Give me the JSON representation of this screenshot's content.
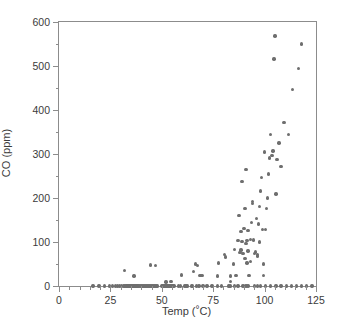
{
  "figure": {
    "caption": ""
  },
  "axes": {
    "x": {
      "title": "Temp (°C)",
      "ticks": [
        "0",
        "25",
        "50",
        "75",
        "100",
        "125"
      ]
    },
    "y": {
      "title": "CO (ppm)",
      "ticks": [
        "0",
        "100",
        "200",
        "300",
        "400",
        "500",
        "600"
      ]
    }
  },
  "chart_data": {
    "type": "scatter",
    "title": "",
    "xlabel": "Temp (°C)",
    "ylabel": "CO (ppm)",
    "xlim": [
      0,
      125
    ],
    "ylim": [
      0,
      600
    ],
    "xticks": [
      0,
      25,
      50,
      75,
      100,
      125
    ],
    "yticks": [
      0,
      100,
      200,
      300,
      400,
      500,
      600
    ],
    "x_minor_ticks_per_interval": 4,
    "y_minor_ticks_per_interval": 1,
    "grid": false,
    "legend": null,
    "marker": {
      "shape": "circle",
      "color": "#6e6e6e",
      "size_px": 3.4
    },
    "frame_color": "#8c8c8c",
    "background": "#ffffff",
    "n_points": 163,
    "series": [
      {
        "name": "CO vs Temp",
        "points": [
          [
            16.5,
            0
          ],
          [
            19.5,
            0
          ],
          [
            22.0,
            0
          ],
          [
            24.5,
            0
          ],
          [
            26.0,
            0
          ],
          [
            27.5,
            0
          ],
          [
            28.5,
            0
          ],
          [
            29.5,
            0
          ],
          [
            30.5,
            0
          ],
          [
            31.5,
            0
          ],
          [
            32.0,
            0
          ],
          [
            32.5,
            0
          ],
          [
            33.0,
            0
          ],
          [
            33.5,
            0
          ],
          [
            34.0,
            0
          ],
          [
            34.5,
            0
          ],
          [
            35.0,
            0
          ],
          [
            35.5,
            0
          ],
          [
            36.0,
            0
          ],
          [
            36.5,
            0
          ],
          [
            37.0,
            0
          ],
          [
            37.5,
            0
          ],
          [
            38.0,
            0
          ],
          [
            38.5,
            0
          ],
          [
            39.0,
            0
          ],
          [
            39.5,
            0
          ],
          [
            40.0,
            0
          ],
          [
            40.5,
            0
          ],
          [
            41.0,
            0
          ],
          [
            41.5,
            0
          ],
          [
            42.0,
            0
          ],
          [
            42.5,
            0
          ],
          [
            43.0,
            0
          ],
          [
            43.5,
            0
          ],
          [
            44.0,
            0
          ],
          [
            44.5,
            0
          ],
          [
            45.0,
            0
          ],
          [
            45.5,
            0
          ],
          [
            46.0,
            0
          ],
          [
            46.5,
            0
          ],
          [
            47.0,
            0
          ],
          [
            47.5,
            0
          ],
          [
            48.0,
            0
          ],
          [
            50.0,
            0
          ],
          [
            50.5,
            0
          ],
          [
            51.0,
            0
          ],
          [
            51.5,
            0
          ],
          [
            52.0,
            0
          ],
          [
            52.5,
            0
          ],
          [
            53.0,
            0
          ],
          [
            53.5,
            0
          ],
          [
            54.0,
            0
          ],
          [
            54.5,
            0
          ],
          [
            55.0,
            0
          ],
          [
            55.5,
            0
          ],
          [
            56.0,
            0
          ],
          [
            58.0,
            0
          ],
          [
            59.0,
            0
          ],
          [
            61.0,
            0
          ],
          [
            61.5,
            0
          ],
          [
            62.0,
            0
          ],
          [
            62.5,
            0
          ],
          [
            64.5,
            0
          ],
          [
            65.0,
            0
          ],
          [
            67.0,
            0
          ],
          [
            68.0,
            0
          ],
          [
            70.0,
            0
          ],
          [
            72.0,
            0
          ],
          [
            74.5,
            0
          ],
          [
            77.0,
            0
          ],
          [
            79.0,
            0
          ],
          [
            82.5,
            0
          ],
          [
            83.0,
            0
          ],
          [
            83.5,
            0
          ],
          [
            85.5,
            0
          ],
          [
            87.0,
            0
          ],
          [
            89.5,
            0
          ],
          [
            91.0,
            0
          ],
          [
            92.0,
            0
          ],
          [
            95.0,
            0
          ],
          [
            96.5,
            0
          ],
          [
            98.0,
            0
          ],
          [
            100.5,
            0
          ],
          [
            103.0,
            0
          ],
          [
            105.5,
            0
          ],
          [
            108.0,
            0
          ],
          [
            110.5,
            0
          ],
          [
            113.0,
            0
          ],
          [
            115.5,
            0
          ],
          [
            118.0,
            0
          ],
          [
            120.5,
            0
          ],
          [
            123.0,
            0
          ],
          [
            32.0,
            35
          ],
          [
            36.5,
            23
          ],
          [
            44.5,
            48
          ],
          [
            47.0,
            47
          ],
          [
            52.0,
            9
          ],
          [
            54.5,
            10
          ],
          [
            59.5,
            25
          ],
          [
            65.5,
            33
          ],
          [
            66.5,
            50
          ],
          [
            67.5,
            47
          ],
          [
            68.5,
            24
          ],
          [
            69.5,
            24
          ],
          [
            77.0,
            23
          ],
          [
            77.5,
            52
          ],
          [
            80.5,
            72
          ],
          [
            81.0,
            66
          ],
          [
            83.5,
            10
          ],
          [
            83.5,
            23
          ],
          [
            85.0,
            50
          ],
          [
            85.5,
            83
          ],
          [
            86.0,
            24
          ],
          [
            87.0,
            103
          ],
          [
            87.5,
            160
          ],
          [
            88.0,
            76
          ],
          [
            88.5,
            82
          ],
          [
            88.5,
            124
          ],
          [
            89.0,
            101
          ],
          [
            89.0,
            238
          ],
          [
            89.5,
            74
          ],
          [
            90.0,
            131
          ],
          [
            90.5,
            63
          ],
          [
            90.5,
            176
          ],
          [
            91.0,
            96
          ],
          [
            91.0,
            265
          ],
          [
            91.5,
            52
          ],
          [
            91.5,
            104
          ],
          [
            92.0,
            80
          ],
          [
            92.0,
            126
          ],
          [
            92.5,
            24
          ],
          [
            93.0,
            56
          ],
          [
            93.0,
            106
          ],
          [
            93.5,
            144
          ],
          [
            94.0,
            188
          ],
          [
            94.0,
            192
          ],
          [
            94.5,
            105
          ],
          [
            95.0,
            74
          ],
          [
            95.5,
            77
          ],
          [
            96.0,
            153
          ],
          [
            96.5,
            68
          ],
          [
            96.5,
            71
          ],
          [
            97.0,
            141
          ],
          [
            97.5,
            100
          ],
          [
            97.5,
            181
          ],
          [
            98.0,
            216
          ],
          [
            98.5,
            247
          ],
          [
            99.0,
            129
          ],
          [
            99.5,
            24
          ],
          [
            99.5,
            50
          ],
          [
            100.0,
            305
          ],
          [
            100.5,
            128
          ],
          [
            101.0,
            176
          ],
          [
            101.5,
            200
          ],
          [
            102.0,
            255
          ],
          [
            102.5,
            291
          ],
          [
            103.0,
            345
          ],
          [
            103.5,
            296
          ],
          [
            104.0,
            307
          ],
          [
            104.5,
            516
          ],
          [
            105.0,
            568
          ],
          [
            105.5,
            209
          ],
          [
            106.0,
            288
          ],
          [
            107.0,
            325
          ],
          [
            108.0,
            271
          ],
          [
            109.5,
            372
          ],
          [
            111.5,
            345
          ],
          [
            113.5,
            447
          ],
          [
            116.5,
            495
          ],
          [
            118.0,
            550
          ]
        ]
      }
    ]
  }
}
